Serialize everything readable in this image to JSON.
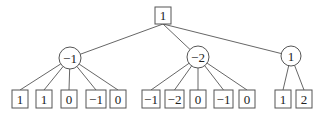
{
  "diagram": {
    "type": "game-tree",
    "root": {
      "id": "root",
      "shape": "square",
      "value": "1",
      "x": 163,
      "y": 15.5,
      "w": 16,
      "h": 17
    },
    "level1": [
      {
        "id": "n1",
        "shape": "circle",
        "value": "−1",
        "cx": 70,
        "cy": 58,
        "r": 11,
        "children": [
          {
            "value": "1",
            "x": 12,
            "w": 16
          },
          {
            "value": "1",
            "x": 36,
            "w": 16
          },
          {
            "value": "0",
            "x": 61,
            "w": 16
          },
          {
            "value": "−1",
            "x": 86,
            "w": 20
          },
          {
            "value": "0",
            "x": 110,
            "w": 16
          }
        ]
      },
      {
        "id": "n2",
        "shape": "circle",
        "value": "−2",
        "cx": 198,
        "cy": 57,
        "r": 11,
        "children": [
          {
            "value": "−1",
            "x": 142,
            "w": 18
          },
          {
            "value": "−2",
            "x": 165,
            "w": 19
          },
          {
            "value": "0",
            "x": 190,
            "w": 16
          },
          {
            "value": "−1",
            "x": 214,
            "w": 19
          },
          {
            "value": "0",
            "x": 239,
            "w": 16
          }
        ]
      },
      {
        "id": "n3",
        "shape": "circle",
        "value": "1",
        "cx": 291,
        "cy": 56,
        "r": 10,
        "children": [
          {
            "value": "1",
            "x": 275,
            "w": 16
          },
          {
            "value": "2",
            "x": 296,
            "w": 16
          }
        ]
      }
    ],
    "leaf_row": {
      "y": 90,
      "h": 18
    }
  }
}
